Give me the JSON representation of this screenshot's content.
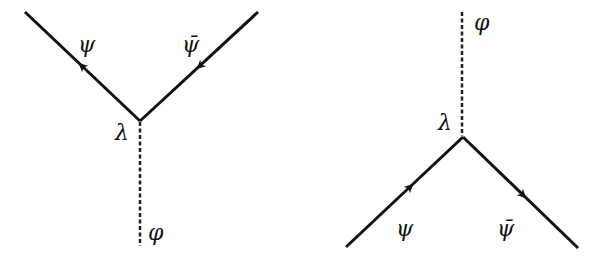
{
  "diagrams": [
    {
      "id": "vertex-decay",
      "vertex_label": "λ",
      "scalar_label": "φ",
      "fermion_label": "ψ",
      "antifermion_label": "ψ̄",
      "vertex": [
        140,
        121
      ],
      "fermion_end": [
        25,
        12
      ],
      "antifermion_end": [
        258,
        12
      ],
      "scalar_end": [
        140,
        246
      ]
    },
    {
      "id": "vertex-annihilation",
      "vertex_label": "λ",
      "scalar_label": "φ",
      "fermion_label": "ψ",
      "antifermion_label": "ψ̄",
      "vertex": [
        463,
        137
      ],
      "fermion_end": [
        346,
        247
      ],
      "antifermion_end": [
        578,
        248
      ],
      "scalar_end": [
        462,
        12
      ]
    }
  ],
  "colors": {
    "line": "#111111",
    "background": "#ffffff"
  }
}
